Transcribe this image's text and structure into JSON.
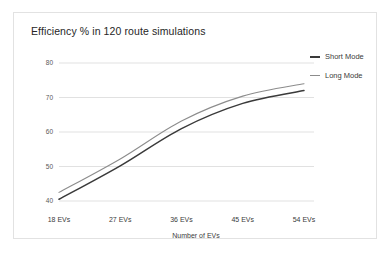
{
  "chart_data": {
    "type": "line",
    "title": "Efficiency % in 120 route simulations",
    "xlabel": "Number of EVs",
    "ylabel": "",
    "categories": [
      "18 EVs",
      "27 EVs",
      "36 EVs",
      "45 EVs",
      "54 EVs"
    ],
    "x": [
      18,
      27,
      36,
      45,
      54
    ],
    "xtick_labels": [
      "18 EVs",
      "27 EVs",
      "36 EVs",
      "45 EVs",
      "54 EVs"
    ],
    "ytick_labels": [
      "80",
      "70",
      "60",
      "50",
      "40"
    ],
    "yticks": [
      80,
      70,
      60,
      50,
      40
    ],
    "ylim": [
      40,
      80
    ],
    "xlim": [
      18,
      54
    ],
    "grid": "horizontal",
    "legend_position": "right",
    "series": [
      {
        "name": "Short Mode",
        "color": "#3a3a3a",
        "values": [
          40.5,
          50.2,
          61.0,
          68.3,
          72.0
        ]
      },
      {
        "name": "Long Mode",
        "color": "#8c8c8c",
        "values": [
          42.5,
          52.2,
          63.2,
          70.4,
          74.0
        ]
      }
    ]
  },
  "legend": {
    "items": [
      {
        "label": "Short Mode",
        "color": "#3a3a3a"
      },
      {
        "label": "Long Mode",
        "color": "#8c8c8c"
      }
    ]
  },
  "colors": {
    "card_border": "#e2e2e2",
    "grid": "#d9d9d9",
    "axis_text": "#595959",
    "title_text": "#262626"
  }
}
